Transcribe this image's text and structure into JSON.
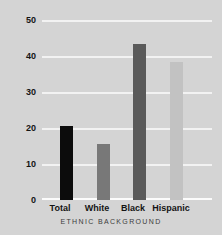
{
  "chart_data": {
    "type": "bar",
    "title": "",
    "subtitle": "",
    "xlabel": "ETHNIC BACKGROUND",
    "ylabel": "",
    "categories": [
      "Total",
      "White",
      "Black",
      "Hispanic"
    ],
    "values": [
      20.8,
      15.8,
      43.7,
      38.8
    ],
    "series": [
      {
        "name": "Percent",
        "values": [
          20.8,
          15.8,
          43.7,
          38.8
        ]
      }
    ],
    "bar_colors": [
      "#0c0c0c",
      "#787878",
      "#5a5a5a",
      "#c2c2c2"
    ],
    "ylim": [
      0,
      50
    ],
    "yticks": [
      0,
      10,
      20,
      30,
      40,
      50
    ],
    "ytick_labels": [
      "0",
      "10",
      "20",
      "30",
      "40",
      "50"
    ],
    "grid": true,
    "grid_axis": "y",
    "grid_color": "#f2f2f2",
    "legend": false,
    "legend_position": "none",
    "background_color": "#d4d4d4",
    "text_color": "#141414"
  },
  "axes": {
    "x_title": "ETHNIC BACKGROUND"
  }
}
